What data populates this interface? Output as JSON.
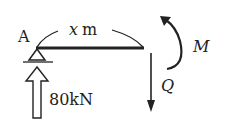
{
  "diagram": {
    "type": "free-body-diagram",
    "support_label": "A",
    "length_var": "x",
    "length_unit": "m",
    "reaction_force": "80kN",
    "shear_label": "Q",
    "moment_label": "M",
    "colors": {
      "ink": "#222222",
      "background": "#ffffff"
    }
  }
}
